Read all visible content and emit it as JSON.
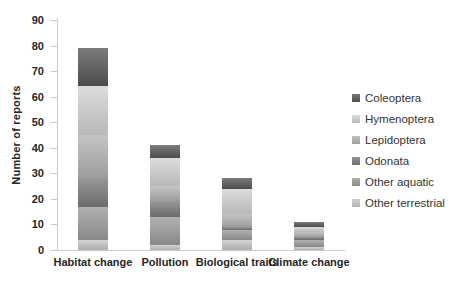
{
  "figure": {
    "background": "#ffffff",
    "text_color": "#262626",
    "axis_line_color": "#c9c9c9"
  },
  "chart_data": {
    "type": "bar",
    "stacked": true,
    "stack_order": "reverse-legend (Other terrestrial at bottom, Coleoptera on top)",
    "title": "",
    "xlabel": "",
    "ylabel": "Number of reports",
    "ylim": [
      0,
      90
    ],
    "y_ticks": [
      0,
      10,
      20,
      30,
      40,
      50,
      60,
      70,
      80,
      90
    ],
    "grid": false,
    "legend_position": "right",
    "categories": [
      "Habitat change",
      "Pollution",
      "Biological traits",
      "Climate change"
    ],
    "series": [
      {
        "name": "Coleoptera",
        "color": "#575757",
        "values": [
          15,
          5,
          4,
          2
        ]
      },
      {
        "name": "Hymenoptera",
        "color": "#d2d2d2",
        "values": [
          19,
          11,
          10,
          2
        ]
      },
      {
        "name": "Lepidoptera",
        "color": "#b3b3b3",
        "values": [
          17,
          6,
          5,
          2
        ]
      },
      {
        "name": "Odonata",
        "color": "#7a7a7a",
        "values": [
          11,
          6,
          1,
          1
        ]
      },
      {
        "name": "Other aquatic",
        "color": "#9b9b9b",
        "values": [
          13,
          11,
          4,
          3
        ]
      },
      {
        "name": "Other terrestrial",
        "color": "#c6c6c6",
        "values": [
          4,
          2,
          4,
          1
        ]
      }
    ],
    "totals": [
      79,
      41,
      28,
      11
    ]
  }
}
